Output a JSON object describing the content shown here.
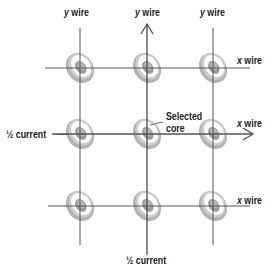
{
  "diagram": {
    "colors": {
      "wire": "#555555",
      "core_outer": "#b0b0b0",
      "core_inner": "#8a8a8a",
      "background": "#ffffff"
    },
    "grid": {
      "columns": 3,
      "rows": 3,
      "vertical_wire_x": [
        80,
        147,
        213
      ],
      "horizontal_wire_y": [
        68,
        134,
        206
      ]
    },
    "labels": {
      "y_wire_1": {
        "prefix": "y",
        "text": " wire"
      },
      "y_wire_2": {
        "prefix": "y",
        "text": " wire"
      },
      "y_wire_3": {
        "prefix": "y",
        "text": " wire"
      },
      "x_wire_1": {
        "prefix": "x",
        "text": " wire"
      },
      "x_wire_2": {
        "prefix": "x",
        "text": " wire"
      },
      "x_wire_3": {
        "prefix": "x",
        "text": " wire"
      },
      "half_current_left": "½ current",
      "half_current_bottom": "½ current",
      "selected_core_line1": "Selected",
      "selected_core_line2": "core"
    },
    "selected_core": {
      "row": 2,
      "column": 2
    }
  }
}
